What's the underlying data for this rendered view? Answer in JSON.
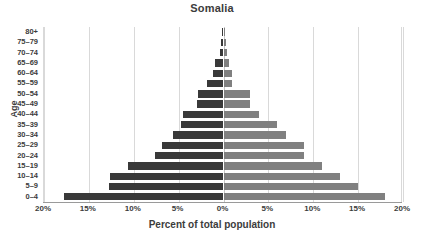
{
  "chart_data": {
    "type": "bar",
    "subtype": "population-pyramid",
    "title": "Somalia",
    "xlabel": "Percent of total population",
    "ylabel": "Age",
    "categories": [
      "80+",
      "75–79",
      "70–74",
      "65–69",
      "60–64",
      "55–59",
      "50–54",
      "45–49",
      "40–44",
      "35–39",
      "30–34",
      "25–29",
      "20–24",
      "15–19",
      "10–14",
      "5–9",
      "0–4"
    ],
    "series": [
      {
        "name": "Male",
        "side": "left",
        "color": "#393939",
        "values": [
          0.2,
          0.3,
          0.4,
          1.0,
          1.2,
          1.8,
          2.8,
          3.0,
          4.5,
          4.7,
          5.6,
          6.8,
          7.6,
          10.6,
          12.6,
          12.8,
          17.8
        ]
      },
      {
        "name": "Female",
        "side": "right",
        "color": "#808080",
        "values": [
          0.2,
          0.3,
          0.4,
          0.6,
          1.0,
          1.0,
          3.0,
          3.0,
          4.0,
          6.0,
          7.0,
          9.0,
          9.0,
          11.0,
          13.0,
          15.0,
          18.0
        ]
      }
    ],
    "xticks": [
      "20%",
      "15%",
      "10%",
      "5%",
      "0%",
      "5%",
      "10%",
      "15%",
      "20%"
    ],
    "xtick_values": [
      -20,
      -15,
      -10,
      -5,
      0,
      5,
      10,
      15,
      20
    ],
    "xlim": [
      -20,
      20
    ],
    "grid": true,
    "legend": "none",
    "gridline_color": "#d9d9d9",
    "background": "#ffffff"
  }
}
